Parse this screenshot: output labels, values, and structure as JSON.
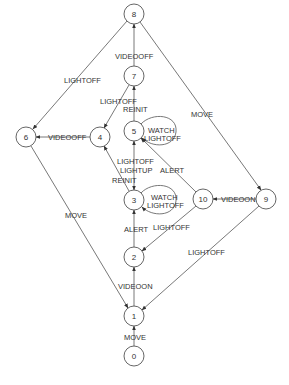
{
  "diagram": {
    "type": "state-transition-graph",
    "colors": {
      "stroke": "#555555",
      "text": "#333333",
      "background": "#ffffff"
    },
    "nodes": [
      {
        "id": "0",
        "label": "0",
        "x": 134,
        "y": 356
      },
      {
        "id": "1",
        "label": "1",
        "x": 134,
        "y": 316
      },
      {
        "id": "2",
        "label": "2",
        "x": 134,
        "y": 257
      },
      {
        "id": "3",
        "label": "3",
        "x": 134,
        "y": 200
      },
      {
        "id": "4",
        "label": "4",
        "x": 100,
        "y": 137
      },
      {
        "id": "5",
        "label": "5",
        "x": 134,
        "y": 131
      },
      {
        "id": "6",
        "label": "6",
        "x": 26,
        "y": 137
      },
      {
        "id": "7",
        "label": "7",
        "x": 134,
        "y": 76
      },
      {
        "id": "8",
        "label": "8",
        "x": 134,
        "y": 14
      },
      {
        "id": "9",
        "label": "9",
        "x": 266,
        "y": 199
      },
      {
        "id": "10",
        "label": "10",
        "x": 203,
        "y": 199
      }
    ],
    "edges": [
      {
        "from": "0",
        "to": "1",
        "label": "MOVE"
      },
      {
        "from": "1",
        "to": "2",
        "label": "VIDEOON"
      },
      {
        "from": "2",
        "to": "3",
        "label": "ALERT"
      },
      {
        "from": "10",
        "to": "2",
        "label": "LIGHTOFF"
      },
      {
        "from": "9",
        "to": "1",
        "label": "LIGHTOFF"
      },
      {
        "from": "9",
        "to": "10",
        "label": "VIDEOON"
      },
      {
        "from": "10",
        "to": "5",
        "label": "ALERT"
      },
      {
        "from": "5",
        "to": "3",
        "label": "LIGHTOFF\nLIGHTUP"
      },
      {
        "from": "3",
        "to": "4",
        "label": "REINIT"
      },
      {
        "from": "3",
        "to": "3",
        "label": "WATCH\nLIGHTOFF"
      },
      {
        "from": "5",
        "to": "5",
        "label": "WATCH\nLIGHTOFF"
      },
      {
        "from": "5",
        "to": "7",
        "label": "REINIT"
      },
      {
        "from": "7",
        "to": "4",
        "label": "LIGHTOFF"
      },
      {
        "from": "7",
        "to": "8",
        "label": "VIDEOOFF"
      },
      {
        "from": "4",
        "to": "6",
        "label": "VIDEOOFF"
      },
      {
        "from": "8",
        "to": "6",
        "label": "LIGHTOFF"
      },
      {
        "from": "8",
        "to": "9",
        "label": "MOVE"
      },
      {
        "from": "6",
        "to": "1",
        "label": "MOVE"
      }
    ],
    "labels": {
      "e_0_1": "MOVE",
      "e_1_2": "VIDEOON",
      "e_2_3": "ALERT",
      "e_10_2": "LIGHTOFF",
      "e_9_1": "LIGHTOFF",
      "e_9_10": "VIDEOON",
      "e_10_5": "ALERT",
      "e_5_3_a": "LIGHTOFF",
      "e_5_3_b": "LIGHTUP",
      "e_3_4": "REINIT",
      "e_3_3_a": "WATCH",
      "e_3_3_b": "LIGHTOFF",
      "e_5_5_a": "WATCH",
      "e_5_5_b": "LIGHTOFF",
      "e_5_7": "REINIT",
      "e_7_4": "LIGHTOFF",
      "e_7_8": "VIDEOOFF",
      "e_4_6": "VIDEOOFF",
      "e_8_6": "LIGHTOFF",
      "e_8_9": "MOVE",
      "e_6_1": "MOVE"
    },
    "node_labels": {
      "n0": "0",
      "n1": "1",
      "n2": "2",
      "n3": "3",
      "n4": "4",
      "n5": "5",
      "n6": "6",
      "n7": "7",
      "n8": "8",
      "n9": "9",
      "n10": "10"
    }
  }
}
